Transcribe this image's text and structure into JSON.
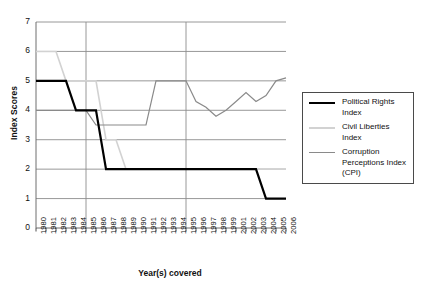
{
  "chart_data": {
    "type": "line",
    "title": "",
    "xlabel": "Year(s) covered",
    "ylabel": "Index Scores",
    "ylim": [
      0,
      7
    ],
    "yticks": [
      0,
      1,
      2,
      3,
      4,
      5,
      6,
      7
    ],
    "grid": "horizontal-gridlines-at-integers, vertical-gridlines-at-1985-and-1995",
    "legend_position": "right-outside",
    "categories": [
      "1980",
      "1981",
      "1982",
      "1983",
      "1984",
      "1985",
      "1986",
      "1987",
      "1988",
      "1989",
      "1990",
      "1991",
      "1992",
      "1993",
      "1994",
      "1995",
      "1996",
      "1997",
      "1998",
      "1999",
      "2001",
      "2002",
      "2003",
      "2004",
      "2005",
      "2006"
    ],
    "series": [
      {
        "name": "Political Rights Index",
        "color": "#000000",
        "width": 2.2,
        "values": [
          5,
          5,
          5,
          5,
          4,
          4,
          4,
          2,
          2,
          2,
          2,
          2,
          2,
          2,
          2,
          2,
          2,
          2,
          2,
          2,
          2,
          2,
          2,
          1,
          1,
          1
        ]
      },
      {
        "name": "Civil Liberties Index",
        "color": "#d2d2d2",
        "width": 1.6,
        "values": [
          6,
          6,
          6,
          5,
          5,
          5,
          5,
          3,
          3,
          2,
          2,
          2,
          2,
          2,
          2,
          2,
          2,
          2,
          2,
          2,
          2,
          2,
          2,
          2,
          2,
          2
        ]
      },
      {
        "name": "Corruption Perceptions Index (CPI)",
        "color": "#8a8a8a",
        "width": 1.2,
        "values": [
          4,
          4,
          4,
          4,
          4,
          4,
          3.5,
          3.5,
          3.5,
          3.5,
          3.5,
          3.5,
          5,
          5,
          5,
          5,
          4.3,
          4.1,
          3.8,
          4.0,
          4.3,
          4.6,
          4.3,
          4.5,
          5.0,
          5.1
        ]
      }
    ]
  },
  "axes": {
    "y_title": "Index Scores",
    "x_title": "Year(s) covered",
    "y_ticks": [
      "0",
      "1",
      "2",
      "3",
      "4",
      "5",
      "6",
      "7"
    ],
    "x_ticks": [
      "1980",
      "1981",
      "1982",
      "1983",
      "1984",
      "1985",
      "1986",
      "1987",
      "1988",
      "1989",
      "1990",
      "1991",
      "1992",
      "1993",
      "1994",
      "1995",
      "1996",
      "1997",
      "1998",
      "1999",
      "2001",
      "2002",
      "2003",
      "2004",
      "2005",
      "2006"
    ]
  },
  "legend": {
    "items": [
      {
        "label_line1": "Political Rights",
        "label_line2": "Index",
        "label_line3": "",
        "color": "#000000"
      },
      {
        "label_line1": "Civil Liberties",
        "label_line2": "Index",
        "label_line3": "",
        "color": "#d2d2d2"
      },
      {
        "label_line1": "Corruption",
        "label_line2": "Perceptions Index",
        "label_line3": "(CPI)",
        "color": "#8a8a8a"
      }
    ]
  }
}
